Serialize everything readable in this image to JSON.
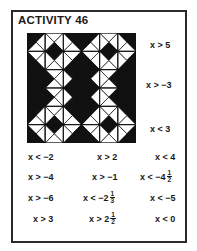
{
  "title": "ACTIVITY 46",
  "colors": {
    "ink": "#111111",
    "paper": "#ffffff",
    "frame": "#2a2a2a"
  },
  "puzzle_grid": {
    "rows": 6,
    "cols": 6,
    "cell_triangles_TRBL": [
      [
        "KWWK",
        "WWKW",
        "KKWW",
        "KWWK",
        "WWKW",
        "KKWW"
      ],
      [
        "WWKK",
        "KWWW",
        "WKKW",
        "WWKK",
        "KWWW",
        "WKKW"
      ],
      [
        "KKKK",
        "WWWK",
        "KKKW",
        "KWKK",
        "WKWW",
        "KKKK"
      ],
      [
        "KKKK",
        "WWWK",
        "KKKW",
        "KWKK",
        "WKWW",
        "KKKK"
      ],
      [
        "KWWK",
        "WWKW",
        "KKWW",
        "KWWK",
        "WWKW",
        "KKWW"
      ],
      [
        "WWKK",
        "KWWW",
        "WKKW",
        "WWKK",
        "KWWW",
        "WKKW"
      ]
    ]
  },
  "side_labels": [
    {
      "text": "x > 5"
    },
    {
      "text": "x > −3"
    },
    {
      "text": "x < 3"
    }
  ],
  "answers": [
    {
      "text": "x < −2"
    },
    {
      "text": "x > 2"
    },
    {
      "text": "x < 4"
    },
    {
      "text": "x > −4"
    },
    {
      "text": "x > −1"
    },
    {
      "text": "x < −4",
      "frac_num": "1",
      "frac_den": "2"
    },
    {
      "text": "x > −6"
    },
    {
      "text": "x < −2",
      "frac_num": "1",
      "frac_den": "3"
    },
    {
      "text": "x < −5"
    },
    {
      "text": "x > 3"
    },
    {
      "text": "x > 2",
      "frac_num": "1",
      "frac_den": "2"
    },
    {
      "text": "x < 0"
    }
  ]
}
